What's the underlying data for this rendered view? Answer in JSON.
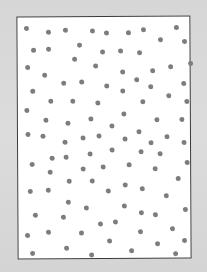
{
  "scene": {
    "description": "Scanned sheet with randomly scattered gray dots inside a rectangle",
    "background_color": "#d9d9d9",
    "sheet_color": "#ffffff",
    "border_color": "#3a3a3a",
    "dot_color": "#7d7d7d",
    "dot_diameter": 5,
    "dot_count": 102
  },
  "dots": [
    [
      26,
      27
    ],
    [
      48,
      31
    ],
    [
      65,
      29
    ],
    [
      92,
      30
    ],
    [
      106,
      32
    ],
    [
      128,
      32
    ],
    [
      143,
      29
    ],
    [
      176,
      27
    ],
    [
      160,
      39
    ],
    [
      184,
      41
    ],
    [
      33,
      49
    ],
    [
      48,
      48
    ],
    [
      79,
      44
    ],
    [
      102,
      51
    ],
    [
      120,
      50
    ],
    [
      139,
      52
    ],
    [
      74,
      58
    ],
    [
      27,
      66
    ],
    [
      95,
      65
    ],
    [
      190,
      63
    ],
    [
      170,
      66
    ],
    [
      44,
      74
    ],
    [
      122,
      71
    ],
    [
      152,
      70
    ],
    [
      63,
      82
    ],
    [
      81,
      81
    ],
    [
      106,
      85
    ],
    [
      136,
      79
    ],
    [
      150,
      86
    ],
    [
      183,
      83
    ],
    [
      32,
      90
    ],
    [
      122,
      90
    ],
    [
      168,
      95
    ],
    [
      50,
      100
    ],
    [
      72,
      100
    ],
    [
      97,
      102
    ],
    [
      142,
      101
    ],
    [
      186,
      101
    ],
    [
      26,
      109
    ],
    [
      45,
      119
    ],
    [
      67,
      122
    ],
    [
      90,
      118
    ],
    [
      123,
      113
    ],
    [
      111,
      125
    ],
    [
      156,
      119
    ],
    [
      181,
      119
    ],
    [
      27,
      133
    ],
    [
      42,
      135
    ],
    [
      64,
      141
    ],
    [
      82,
      137
    ],
    [
      98,
      135
    ],
    [
      124,
      138
    ],
    [
      138,
      131
    ],
    [
      150,
      142
    ],
    [
      166,
      136
    ],
    [
      183,
      142
    ],
    [
      31,
      163
    ],
    [
      51,
      157
    ],
    [
      65,
      156
    ],
    [
      89,
      153
    ],
    [
      111,
      149
    ],
    [
      140,
      151
    ],
    [
      159,
      153
    ],
    [
      186,
      162
    ],
    [
      49,
      171
    ],
    [
      82,
      168
    ],
    [
      102,
      166
    ],
    [
      128,
      164
    ],
    [
      154,
      168
    ],
    [
      68,
      180
    ],
    [
      91,
      180
    ],
    [
      177,
      178
    ],
    [
      124,
      184
    ],
    [
      47,
      189
    ],
    [
      141,
      188
    ],
    [
      107,
      190
    ],
    [
      29,
      190
    ],
    [
      67,
      201
    ],
    [
      85,
      207
    ],
    [
      123,
      205
    ],
    [
      165,
      195
    ],
    [
      34,
      214
    ],
    [
      62,
      216
    ],
    [
      140,
      212
    ],
    [
      154,
      214
    ],
    [
      184,
      209
    ],
    [
      99,
      223
    ],
    [
      114,
      221
    ],
    [
      47,
      231
    ],
    [
      80,
      232
    ],
    [
      139,
      231
    ],
    [
      171,
      228
    ],
    [
      26,
      234
    ],
    [
      108,
      240
    ],
    [
      65,
      247
    ],
    [
      156,
      243
    ],
    [
      183,
      240
    ],
    [
      31,
      252
    ],
    [
      90,
      254
    ],
    [
      130,
      250
    ],
    [
      174,
      253
    ]
  ]
}
